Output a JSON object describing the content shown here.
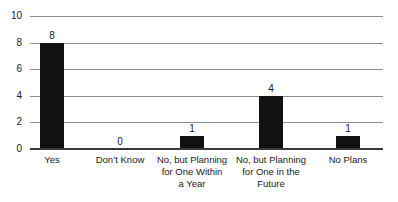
{
  "chart_data": {
    "type": "bar",
    "title": "",
    "xlabel": "",
    "ylabel": "",
    "ylim": [
      0,
      10
    ],
    "yticks": [
      0,
      2,
      4,
      6,
      8,
      10
    ],
    "grid": true,
    "legend": null,
    "categories": [
      "Yes",
      "Don't Know",
      "No, but Planning for One Within a Year",
      "No, but Planning for One in the Future",
      "No Plans"
    ],
    "values": [
      8,
      0,
      1,
      4,
      1
    ],
    "data_labels": [
      "8",
      "0",
      "1",
      "4",
      "1"
    ],
    "bar_color": "#111111"
  },
  "axis": {
    "ticks": [
      "0",
      "2",
      "4",
      "6",
      "8",
      "10"
    ]
  },
  "categories_display": [
    [
      "Yes"
    ],
    [
      "Don’t Know"
    ],
    [
      "No, but Planning",
      "for One Within",
      "a Year"
    ],
    [
      "No, but Planning",
      "for One in the",
      "Future"
    ],
    [
      "No Plans"
    ]
  ]
}
